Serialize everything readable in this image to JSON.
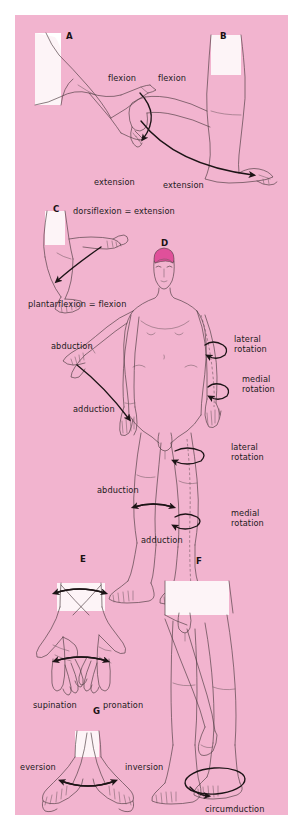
{
  "figure": {
    "background_color": "#ffffff",
    "panel_color": "#f2b4cf",
    "ink_color": "#241a1c",
    "hair_color": "#e0509a",
    "skin_color": "#fdf4f7"
  },
  "panels": [
    {
      "letter": "A",
      "subject": "elbow",
      "labels": [
        {
          "text": "flexion"
        },
        {
          "text": "extension"
        }
      ]
    },
    {
      "letter": "B",
      "subject": "knee",
      "labels": [
        {
          "text": "flexion"
        },
        {
          "text": "extension"
        }
      ]
    },
    {
      "letter": "C",
      "subject": "ankle",
      "labels": [
        {
          "text": "dorsiflexion = extension"
        },
        {
          "text": "plantarflexion = flexion"
        }
      ]
    },
    {
      "letter": "D",
      "subject": "whole body",
      "labels": [
        {
          "text": "abduction"
        },
        {
          "text": "adduction"
        },
        {
          "text": "lateral"
        },
        {
          "text": "rotation"
        },
        {
          "text": "medial"
        },
        {
          "text": "rotation"
        },
        {
          "text": "lateral"
        },
        {
          "text": "rotation"
        },
        {
          "text": "medial"
        },
        {
          "text": "rotation"
        },
        {
          "text": "abduction"
        },
        {
          "text": "adduction"
        }
      ]
    },
    {
      "letter": "E",
      "subject": "forearm",
      "labels": [
        {
          "text": "supination"
        },
        {
          "text": "pronation"
        }
      ]
    },
    {
      "letter": "F",
      "subject": "hip",
      "labels": [
        {
          "text": "circumduction"
        }
      ]
    },
    {
      "letter": "G",
      "subject": "foot",
      "labels": [
        {
          "text": "eversion"
        },
        {
          "text": "inversion"
        }
      ]
    }
  ],
  "labels": {
    "a_flexion": "flexion",
    "a_extension": "extension",
    "b_flexion": "flexion",
    "b_extension": "extension",
    "c_dorsiflexion": "dorsiflexion = extension",
    "c_plantarflexion": "plantarflexion = flexion",
    "d_arm_abduction": "abduction",
    "d_arm_adduction": "adduction",
    "d_arm_lateral_1": "lateral",
    "d_arm_lateral_2": "rotation",
    "d_arm_medial_1": "medial",
    "d_arm_medial_2": "rotation",
    "d_leg_lateral_1": "lateral",
    "d_leg_lateral_2": "rotation",
    "d_leg_medial_1": "medial",
    "d_leg_medial_2": "rotation",
    "d_leg_abduction": "abduction",
    "d_leg_adduction": "adduction",
    "e_supination": "supination",
    "e_pronation": "pronation",
    "f_circumduction": "circumduction",
    "g_eversion": "eversion",
    "g_inversion": "inversion"
  },
  "panel_letters": {
    "a": "A",
    "b": "B",
    "c": "C",
    "d": "D",
    "e": "E",
    "f": "F",
    "g": "G"
  }
}
